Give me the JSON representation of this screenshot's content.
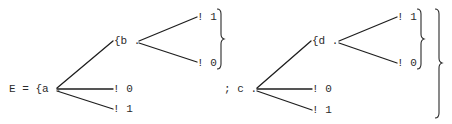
{
  "diagram": {
    "type": "typewritten-tree-expression",
    "expression_prefix": "E = {a .",
    "separator": "; c .",
    "left_tree": {
      "root": "a",
      "sub_label": "{b .",
      "sub_root": "b",
      "sub_leaves": [
        "! 1",
        "! 0"
      ],
      "leaves": [
        "! 0",
        "! 1"
      ]
    },
    "right_tree": {
      "root": "c",
      "sub_label": "{d .",
      "sub_root": "d",
      "sub_leaves": [
        "! 1",
        "! 0"
      ],
      "leaves": [
        "! 0",
        "! 1"
      ]
    },
    "ink_color": "#1e1e1e",
    "background_color": "#ffffff"
  }
}
